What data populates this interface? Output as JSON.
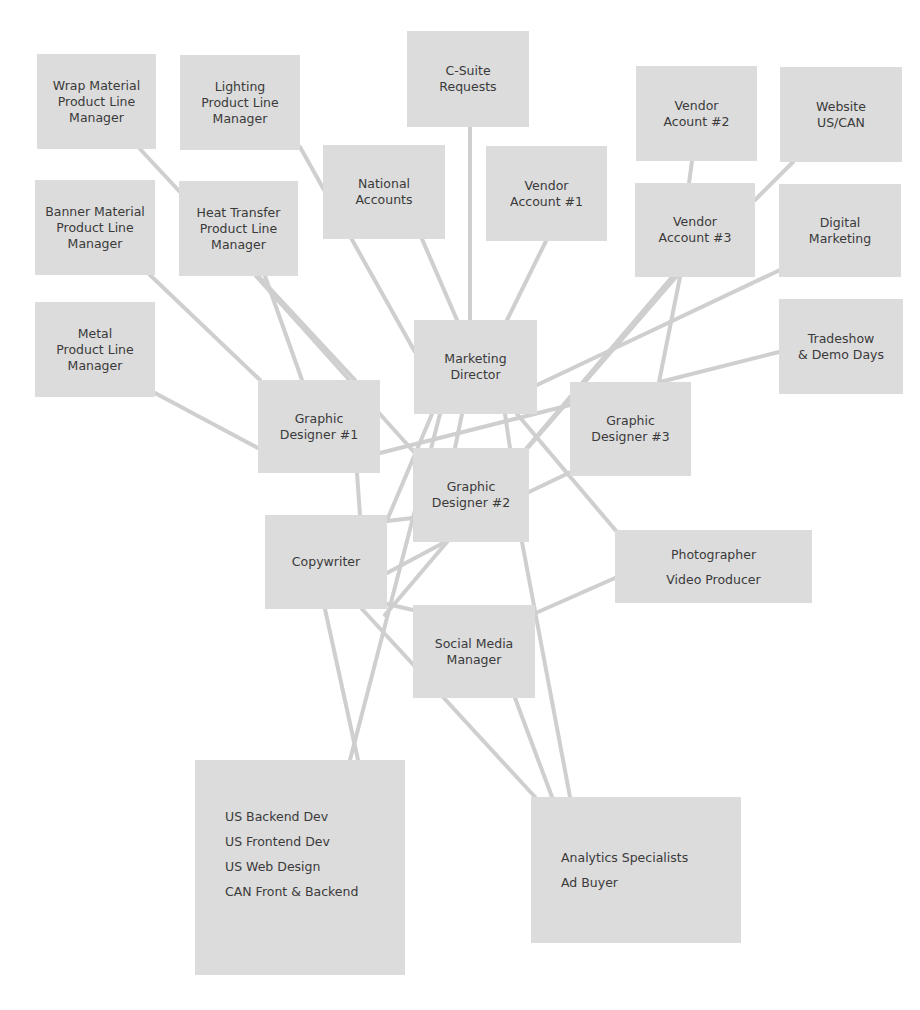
{
  "diagram": {
    "type": "org-chart-network",
    "colors": {
      "background": "#ffffff",
      "node_fill": "#dcdcdc",
      "edge": "#cfcfcf",
      "text": "#3a3a3a"
    },
    "nodes": [
      {
        "id": "wrap",
        "lines": [
          "Wrap Material",
          "Product Line",
          "Manager"
        ]
      },
      {
        "id": "lighting",
        "lines": [
          "Lighting",
          "Product Line",
          "Manager"
        ]
      },
      {
        "id": "csuite",
        "lines": [
          "C-Suite",
          "Requests"
        ]
      },
      {
        "id": "vendor2",
        "lines": [
          "Vendor",
          "Acount #2"
        ]
      },
      {
        "id": "website",
        "lines": [
          "Website",
          "US/CAN"
        ]
      },
      {
        "id": "banner",
        "lines": [
          "Banner Material",
          "Product Line",
          "Manager"
        ]
      },
      {
        "id": "heat",
        "lines": [
          "Heat Transfer",
          "Product Line",
          "Manager"
        ]
      },
      {
        "id": "national",
        "lines": [
          "National",
          "Accounts"
        ]
      },
      {
        "id": "vendor1",
        "lines": [
          "Vendor",
          "Account #1"
        ]
      },
      {
        "id": "vendor3",
        "lines": [
          "Vendor",
          "Account #3"
        ]
      },
      {
        "id": "digital",
        "lines": [
          "Digital",
          "Marketing"
        ]
      },
      {
        "id": "metal",
        "lines": [
          "Metal",
          "Product Line",
          "Manager"
        ]
      },
      {
        "id": "tradeshow",
        "lines": [
          "Tradeshow",
          "& Demo Days"
        ]
      },
      {
        "id": "director",
        "lines": [
          "Marketing",
          "Director"
        ]
      },
      {
        "id": "gd1",
        "lines": [
          "Graphic",
          "Designer #1"
        ]
      },
      {
        "id": "gd3",
        "lines": [
          "Graphic",
          "Designer #3"
        ]
      },
      {
        "id": "gd2",
        "lines": [
          "Graphic",
          "Designer #2"
        ]
      },
      {
        "id": "copywriter",
        "lines": [
          "Copywriter"
        ]
      },
      {
        "id": "photo",
        "lines": [
          "Photographer",
          "Video Producer"
        ]
      },
      {
        "id": "social",
        "lines": [
          "Social Media",
          "Manager"
        ]
      },
      {
        "id": "dev",
        "lines": [
          "US Backend Dev",
          "US Frontend Dev",
          "US Web Design",
          "CAN Front & Backend"
        ]
      },
      {
        "id": "analytics",
        "lines": [
          "Analytics Specialists",
          "Ad Buyer"
        ]
      }
    ],
    "edges": [
      {
        "from": "wrap",
        "to": "gd1",
        "x1": 140,
        "y1": 149,
        "x2": 355,
        "y2": 380
      },
      {
        "from": "lighting",
        "to": "director",
        "x1": 300,
        "y1": 147,
        "x2": 415,
        "y2": 352
      },
      {
        "from": "csuite",
        "to": "director",
        "x1": 470,
        "y1": 127,
        "x2": 470,
        "y2": 320
      },
      {
        "from": "vendor2",
        "to": "vendor3",
        "x1": 692,
        "y1": 161,
        "x2": 689,
        "y2": 183
      },
      {
        "from": "website",
        "to": "vendor3",
        "x1": 793,
        "y1": 162,
        "x2": 755,
        "y2": 200
      },
      {
        "from": "banner",
        "to": "gd1",
        "x1": 150,
        "y1": 275,
        "x2": 260,
        "y2": 380
      },
      {
        "from": "heat",
        "to": "gd1",
        "x1": 265,
        "y1": 276,
        "x2": 302,
        "y2": 380
      },
      {
        "from": "heat",
        "to": "gd2",
        "x1": 256,
        "y1": 276,
        "x2": 414,
        "y2": 452
      },
      {
        "from": "national",
        "to": "director",
        "x1": 422,
        "y1": 239,
        "x2": 457,
        "y2": 320
      },
      {
        "from": "vendor1",
        "to": "director",
        "x1": 546,
        "y1": 241,
        "x2": 507,
        "y2": 320
      },
      {
        "from": "vendor3",
        "to": "gd3",
        "x1": 680,
        "y1": 277,
        "x2": 659,
        "y2": 382
      },
      {
        "from": "vendor3",
        "to": "gd2",
        "x1": 676,
        "y1": 277,
        "x2": 500,
        "y2": 480
      },
      {
        "from": "vendor3",
        "to": "copywriter",
        "x1": 672,
        "y1": 277,
        "x2": 385,
        "y2": 615
      },
      {
        "from": "digital",
        "to": "director",
        "x1": 780,
        "y1": 270,
        "x2": 537,
        "y2": 385
      },
      {
        "from": "metal",
        "to": "gd1",
        "x1": 155,
        "y1": 393,
        "x2": 258,
        "y2": 448
      },
      {
        "from": "tradeshow",
        "to": "gd3",
        "x1": 779,
        "y1": 352,
        "x2": 660,
        "y2": 382
      },
      {
        "from": "gd1",
        "to": "gd3",
        "x1": 380,
        "y1": 453,
        "x2": 570,
        "y2": 405
      },
      {
        "from": "director",
        "to": "copywriter",
        "x1": 432,
        "y1": 414,
        "x2": 388,
        "y2": 518
      },
      {
        "from": "director",
        "to": "gd2",
        "x1": 462,
        "y1": 414,
        "x2": 455,
        "y2": 448
      },
      {
        "from": "director",
        "to": "gd2b",
        "x1": 505,
        "y1": 414,
        "x2": 510,
        "y2": 448
      },
      {
        "from": "director",
        "to": "photo",
        "x1": 517,
        "y1": 414,
        "x2": 617,
        "y2": 532
      },
      {
        "from": "gd1",
        "to": "copywriter",
        "x1": 357,
        "y1": 473,
        "x2": 360,
        "y2": 515
      },
      {
        "from": "gd2",
        "to": "gd3",
        "x1": 529,
        "y1": 492,
        "x2": 575,
        "y2": 470
      },
      {
        "from": "copywriter",
        "to": "gd2",
        "x1": 387,
        "y1": 521,
        "x2": 413,
        "y2": 518
      },
      {
        "from": "copywriter",
        "to": "gd2c",
        "x1": 387,
        "y1": 573,
        "x2": 445,
        "y2": 542
      },
      {
        "from": "director",
        "to": "dev",
        "x1": 440,
        "y1": 414,
        "x2": 350,
        "y2": 760
      },
      {
        "from": "copywriter",
        "to": "dev",
        "x1": 325,
        "y1": 609,
        "x2": 358,
        "y2": 760
      },
      {
        "from": "copywriter",
        "to": "analytics",
        "x1": 362,
        "y1": 609,
        "x2": 535,
        "y2": 797
      },
      {
        "from": "copywriter",
        "to": "social",
        "x1": 387,
        "y1": 604,
        "x2": 413,
        "y2": 610
      },
      {
        "from": "social",
        "to": "analytics",
        "x1": 515,
        "y1": 698,
        "x2": 552,
        "y2": 797
      },
      {
        "from": "gd2",
        "to": "analytics",
        "x1": 522,
        "y1": 542,
        "x2": 570,
        "y2": 797
      },
      {
        "from": "photo",
        "to": "social",
        "x1": 615,
        "y1": 578,
        "x2": 538,
        "y2": 612
      }
    ]
  }
}
